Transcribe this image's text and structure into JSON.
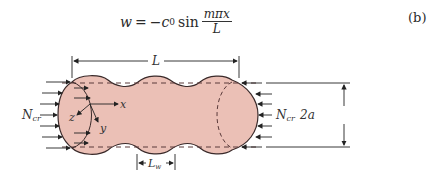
{
  "equation": {
    "lhs": "w",
    "equals": "=",
    "coefficient": "−c",
    "coefficient_sub": "0",
    "function": "sin",
    "numerator": "mπx",
    "denominator": "L",
    "tag": "(b)"
  },
  "figure": {
    "labels": {
      "length": "L",
      "wave_length": "L",
      "wave_length_sub": "w",
      "load_left": "N",
      "load_left_sub": "cr",
      "load_right": "N",
      "load_right_sub": "cr",
      "diameter": "2a",
      "axis_x": "x",
      "axis_y": "y",
      "axis_z": "z"
    },
    "colors": {
      "shell_fill": "#EBC0B6",
      "outline": "#3a2a2a",
      "dash": "#5a3a3a"
    }
  }
}
